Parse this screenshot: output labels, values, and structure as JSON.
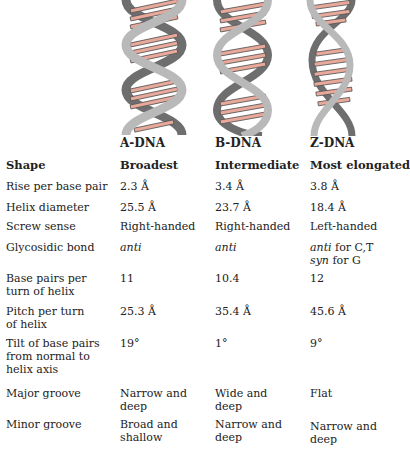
{
  "columns": [
    "A-DNA",
    "B-DNA",
    "Z-DNA"
  ],
  "colors": {
    "backbone_light": "#b9b9b9",
    "backbone_dark": "#6e6e6e",
    "base_pair": "#e8a89a",
    "outline": "#555555"
  },
  "rows": [
    {
      "label": "Shape",
      "a": "Broadest",
      "b": "Intermediate",
      "z": "Most elongated"
    },
    {
      "label": "Rise per base pair",
      "a": "2.3 Å",
      "b": "3.4 Å",
      "z": "3.8 Å"
    },
    {
      "label": "Helix diameter",
      "a": "25.5 Å",
      "b": "23.7 Å",
      "z": "18.4 Å"
    },
    {
      "label": "Screw sense",
      "a": "Right-handed",
      "b": "Right-handed",
      "z": "Left-handed"
    },
    {
      "label": "Glycosidic bond",
      "a": "anti",
      "b": "anti",
      "z_line1_it": "anti",
      "z_line1_rest": " for C,T",
      "z_line2_it": "syn",
      "z_line2_rest": " for G"
    },
    {
      "label_line1": "Base pairs per",
      "label_line2": "turn of helix",
      "a": "11",
      "b": "10.4",
      "z": "12"
    },
    {
      "label_line1": "Pitch per turn",
      "label_line2": "of helix",
      "a": "25.3 Å",
      "b": "35.4 Å",
      "z": "45.6 Å"
    },
    {
      "label_line1": "Tilt of base pairs",
      "label_line2": "from normal to",
      "label_line3": "helix axis",
      "a": "19°",
      "b": "1°",
      "z": "9°"
    },
    {
      "label": "Major groove",
      "a_line1": "Narrow and",
      "a_line2": "deep",
      "b_line1": "Wide and",
      "b_line2": "deep",
      "z": "Flat"
    },
    {
      "label": "Minor groove",
      "a_line1": "Broad and",
      "a_line2": "shallow",
      "b_line1": "Narrow and",
      "b_line2": "deep",
      "z_line1": "Narrow and",
      "z_line2": "deep"
    }
  ]
}
